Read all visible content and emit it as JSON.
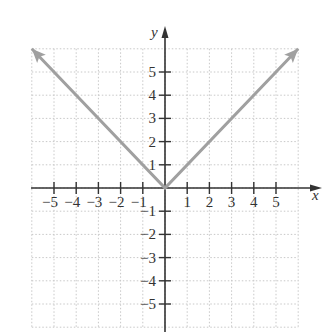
{
  "chart_data": {
    "type": "line",
    "title": "",
    "xlabel": "x",
    "ylabel": "y",
    "xlim": [
      -6,
      6
    ],
    "ylim": [
      -6,
      6
    ],
    "grid": true,
    "x_ticks": [
      -5,
      -4,
      -3,
      -2,
      -1,
      1,
      2,
      3,
      4,
      5
    ],
    "y_ticks": [
      -5,
      -4,
      -3,
      -2,
      -1,
      1,
      2,
      3,
      4,
      5
    ],
    "x_tick_labels": [
      "−5",
      "−4",
      "−3",
      "−2",
      "−1",
      "1",
      "2",
      "3",
      "4",
      "5"
    ],
    "y_tick_labels": [
      "−5",
      "−4",
      "−3",
      "−2",
      "−1",
      "1",
      "2",
      "3",
      "4",
      "5"
    ],
    "series": [
      {
        "name": "y = |x|",
        "color": "#a0a0a0",
        "x": [
          -6,
          0,
          6
        ],
        "y": [
          6,
          0,
          6
        ],
        "arrows": [
          "start",
          "end"
        ]
      }
    ],
    "legend": null
  },
  "colors": {
    "axis": "#333333",
    "grid": "#c8c8c8",
    "curve": "#a0a0a0"
  }
}
